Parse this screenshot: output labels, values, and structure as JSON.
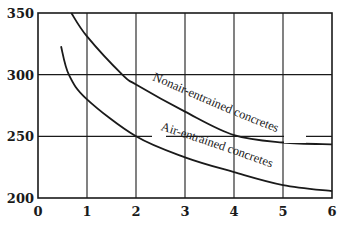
{
  "chart_data": {
    "type": "line",
    "title": "",
    "xlabel": "",
    "ylabel": "",
    "xlim": [
      0,
      6
    ],
    "ylim": [
      200,
      350
    ],
    "grid": true,
    "legend": "inline curve labels",
    "x_ticks": [
      "0",
      "1",
      "2",
      "3",
      "4",
      "5",
      "6"
    ],
    "y_ticks": [
      "200",
      "250",
      "300",
      "350"
    ],
    "series": [
      {
        "name": "Nonair-entrained concretes",
        "x": [
          0.68,
          1.0,
          1.72,
          2.0,
          3.0,
          4.0,
          5.0,
          6.0
        ],
        "values": [
          350,
          331,
          300,
          292,
          270,
          251,
          245,
          243.5
        ]
      },
      {
        "name": "Air-entrained concretes",
        "x": [
          0.47,
          0.63,
          1.0,
          2.0,
          3.0,
          4.0,
          5.0,
          6.0
        ],
        "values": [
          323,
          300,
          280,
          250,
          233,
          221,
          210.5,
          205.5
        ]
      }
    ]
  },
  "colors": {
    "line": "#1a1a1a",
    "grid": "#1a1a1a",
    "background": "#ffffff"
  }
}
